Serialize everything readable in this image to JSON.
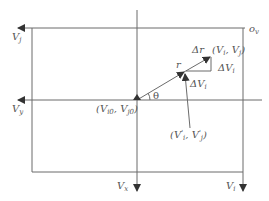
{
  "diagram": {
    "type": "velocity-space vector diagram",
    "stroke_color": "#6b6b6b",
    "text_color": "#555555",
    "axes": {
      "top_left_axis": {
        "label": "V",
        "subscript": "j"
      },
      "middle_left_axis": {
        "label": "V",
        "subscript": "y"
      },
      "bottom_middle_axis": {
        "label": "V",
        "subscript": "x"
      },
      "bottom_right_axis": {
        "label": "V",
        "subscript": "i"
      },
      "origin_corner": {
        "label": "o",
        "subscript": "v"
      }
    },
    "points": {
      "origin": {
        "text": "(V",
        "sub1": "i0",
        "mid": ", V",
        "sub2": "j0",
        "end": ")"
      },
      "prime_point": {
        "text": "(V",
        "sup1": "'",
        "sub1": "i",
        "mid": ", V",
        "sup2": "'",
        "sub2": "j",
        "end": ")"
      },
      "target_point": {
        "text": "(V",
        "sub1": "i",
        "mid": ", V",
        "sub2": "j",
        "end": ")"
      }
    },
    "vector_labels": {
      "r": "r",
      "delta_r": "Δr",
      "theta": "θ",
      "delta_vi_horizontal": "ΔV",
      "delta_vi_horizontal_sub": "i",
      "delta_vi_vertical": "ΔV",
      "delta_vi_vertical_sub": "i"
    }
  }
}
